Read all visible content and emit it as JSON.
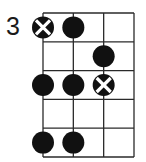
{
  "diagram": {
    "type": "bass-fretboard-scale-diagram",
    "start_fret_label": "3",
    "strings": 4,
    "frets": 5,
    "colors": {
      "background": "#ffffff",
      "grid": "#2a2a2a",
      "dot": "#111111",
      "root_cross": "#ffffff"
    },
    "notes": [
      {
        "fret": 1,
        "string": 1,
        "kind": "root"
      },
      {
        "fret": 1,
        "string": 2,
        "kind": "note"
      },
      {
        "fret": 2,
        "string": 3,
        "kind": "note"
      },
      {
        "fret": 3,
        "string": 1,
        "kind": "note"
      },
      {
        "fret": 3,
        "string": 2,
        "kind": "note"
      },
      {
        "fret": 3,
        "string": 3,
        "kind": "root"
      },
      {
        "fret": 5,
        "string": 1,
        "kind": "note"
      },
      {
        "fret": 5,
        "string": 2,
        "kind": "note"
      }
    ]
  }
}
